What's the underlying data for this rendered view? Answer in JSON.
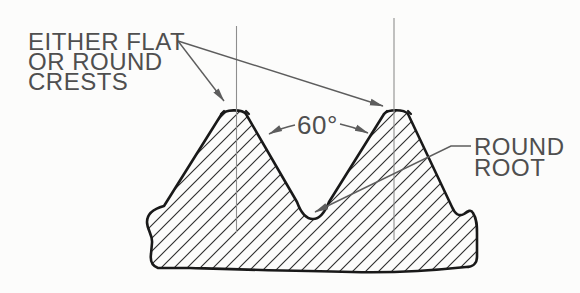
{
  "diagram": {
    "crest_label": {
      "line1": "EITHER FLAT",
      "line2": "OR ROUND",
      "line3": "CRESTS"
    },
    "angle_label": "60°",
    "root_label": {
      "line1": "ROUND",
      "line2": "ROOT"
    },
    "colors": {
      "background": "#fcfcfb",
      "outline": "#191919",
      "hatching": "#2e2e2e",
      "annotation": "#5d5d5d",
      "centerline": "#8e8e8e",
      "text": "#4f4f4f"
    }
  }
}
